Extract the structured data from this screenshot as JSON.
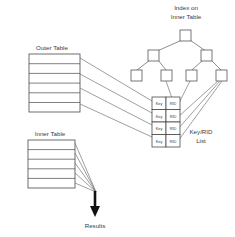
{
  "diagram": {
    "title_index": {
      "line1": "Index on",
      "line2": "Inner Table"
    },
    "outer_table": {
      "label": "Outer Table",
      "row_count": 6
    },
    "inner_table": {
      "label": "Inner Table",
      "row_count": 5
    },
    "keyrid_list": {
      "label_line1": "Key/RID",
      "label_line2": "List",
      "column_headers": [
        "Key",
        "RID"
      ],
      "rows": [
        {
          "key": "Key",
          "rid": "RID"
        },
        {
          "key": "Key",
          "rid": "RID"
        },
        {
          "key": "Key",
          "rid": "RID"
        },
        {
          "key": "Key",
          "rid": "RID"
        }
      ]
    },
    "results": {
      "label": "Results"
    },
    "tree": {
      "levels": 3,
      "root_count": 1,
      "internal_count": 2,
      "leaf_count": 4
    },
    "colors": {
      "background": "#ffffff",
      "stroke": "#4a4a4a",
      "connector": "#6b6b6b",
      "text": "#3a3a3a",
      "arrow": "#111111"
    }
  }
}
